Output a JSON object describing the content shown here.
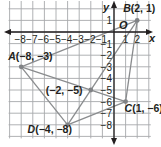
{
  "diagram": {
    "type": "coordinate-plane",
    "origin_label": "O",
    "x_axis_label": "x",
    "y_axis_label": "y",
    "x_ticks": [
      "-8",
      "-7",
      "-6",
      "-5",
      "-4",
      "-3",
      "-2",
      "-1",
      "1",
      "2"
    ],
    "y_ticks": [
      "1",
      "-1",
      "-2",
      "-3",
      "-4",
      "-5",
      "-6",
      "-7",
      "-8"
    ],
    "points": [
      {
        "name": "A",
        "x": -8,
        "y": -3,
        "label": "A(−8, −3)"
      },
      {
        "name": "B",
        "x": 2,
        "y": 1,
        "label": "B(2, 1)"
      },
      {
        "name": "C",
        "x": 1,
        "y": -6,
        "label": "C(1, −6)"
      },
      {
        "name": "D",
        "x": -4,
        "y": -8,
        "label": "D(−4, −8)"
      },
      {
        "name": "E",
        "x": -2,
        "y": -5,
        "label": "(−2, −5)"
      }
    ],
    "segments": [
      [
        "A",
        "B"
      ],
      [
        "B",
        "C"
      ],
      [
        "C",
        "D"
      ],
      [
        "D",
        "A"
      ],
      [
        "A",
        "C"
      ],
      [
        "B",
        "D"
      ]
    ],
    "colors": {
      "grid": "#a7a9ac",
      "axis": "#231f20",
      "segment": "#8a8c8e",
      "point": "#808285",
      "text": "#231f20"
    }
  }
}
